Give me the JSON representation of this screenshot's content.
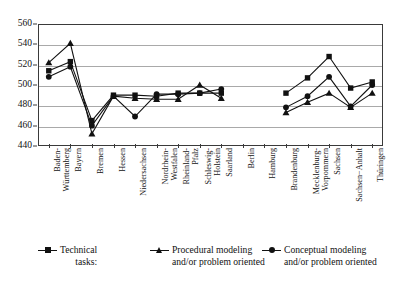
{
  "chart_data": {
    "type": "line",
    "title": "",
    "xlabel": "",
    "ylabel": "",
    "ylim": [
      440,
      560
    ],
    "yticks": [
      440,
      460,
      480,
      500,
      520,
      540,
      560
    ],
    "grid": true,
    "legend_position": "bottom",
    "categories": [
      "Baden-\nWürttemberg",
      "Bayern",
      "Bremen",
      "Hessen",
      "Niedersachsen",
      "Nordrhein-\nWestfalen",
      "Rheinland-\nPfalz",
      "Schleswig-\nHolstein",
      "Saarland",
      "Berlin",
      "Hamburg",
      "Brandenburg",
      "Mecklenburg-\nVorpommern",
      "Sachsen",
      "Sachsen−Anhalt",
      "Thüringen"
    ],
    "series": [
      {
        "name": "Technical tasks:",
        "marker": "square",
        "values": [
          514,
          523,
          465,
          490,
          490,
          489,
          492,
          492,
          492,
          null,
          null,
          492,
          507,
          528,
          497,
          503
        ]
      },
      {
        "name": "Procedural modeling and/or problem oriented",
        "marker": "triangle",
        "values": [
          522,
          541,
          452,
          489,
          487,
          486,
          486,
          500,
          487,
          null,
          null,
          473,
          483,
          492,
          478,
          492
        ]
      },
      {
        "name": "Conceptual modeling and/or problem oriented",
        "marker": "circle",
        "values": [
          508,
          518,
          460,
          489,
          469,
          491,
          491,
          492,
          496,
          null,
          null,
          478,
          489,
          508,
          479,
          500
        ]
      }
    ]
  },
  "legend": {
    "items": [
      {
        "label": "Technical\ntasks:",
        "marker": "square"
      },
      {
        "label": "Procedural modeling\nand/or problem oriented",
        "marker": "triangle"
      },
      {
        "label": "Conceptual modeling\nand/or problem oriented",
        "marker": "circle"
      }
    ]
  },
  "colors": {
    "series": "#111111",
    "grid": "#a9a9a9",
    "frame": "#3a3a3a",
    "background": "#ffffff"
  }
}
